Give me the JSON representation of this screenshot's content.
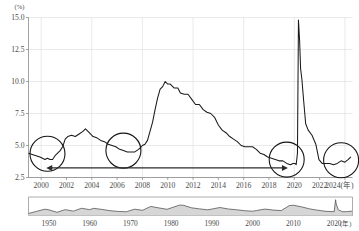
{
  "chart_data": {
    "type": "line",
    "title": "",
    "subtitle": "",
    "xlabel": "",
    "ylabel": "",
    "y_unit_label": "(%)",
    "x_unit_label": "(年)",
    "ylim": [
      2.5,
      15.0
    ],
    "xlim": [
      1999.0,
      2024.6
    ],
    "grid": true,
    "legend_position": "none",
    "y_ticks": [
      "15.0",
      "12.5",
      "10.0",
      "7.5",
      "5.0",
      "2.5"
    ],
    "y_tick_values": [
      15.0,
      12.5,
      10.0,
      7.5,
      5.0,
      2.5
    ],
    "x_ticks": [
      "2000",
      "2002",
      "2004",
      "2006",
      "2008",
      "2010",
      "2012",
      "2014",
      "2016",
      "2018",
      "2020",
      "2022",
      "2024"
    ],
    "x_tick_values": [
      2000,
      2002,
      2004,
      2006,
      2008,
      2010,
      2012,
      2014,
      2016,
      2018,
      2020,
      2022,
      2024
    ],
    "series": [
      {
        "name": "unemployment-rate",
        "x": [
          1999.0,
          1999.3,
          1999.6,
          1999.9,
          2000.1,
          2000.3,
          2000.5,
          2000.7,
          2000.9,
          2001.1,
          2001.3,
          2001.5,
          2001.7,
          2001.9,
          2002.1,
          2002.4,
          2002.7,
          2003.0,
          2003.3,
          2003.5,
          2003.8,
          2004.1,
          2004.4,
          2004.7,
          2005.0,
          2005.3,
          2005.6,
          2005.9,
          2006.2,
          2006.5,
          2006.8,
          2007.1,
          2007.4,
          2007.7,
          2008.0,
          2008.2,
          2008.4,
          2008.6,
          2008.8,
          2009.0,
          2009.2,
          2009.4,
          2009.6,
          2009.8,
          2010.0,
          2010.2,
          2010.5,
          2010.8,
          2011.0,
          2011.3,
          2011.6,
          2011.9,
          2012.2,
          2012.5,
          2012.8,
          2013.1,
          2013.4,
          2013.7,
          2014.0,
          2014.3,
          2014.6,
          2014.9,
          2015.2,
          2015.5,
          2015.8,
          2016.1,
          2016.4,
          2016.7,
          2017.0,
          2017.3,
          2017.6,
          2017.9,
          2018.2,
          2018.5,
          2018.8,
          2019.1,
          2019.4,
          2019.7,
          2019.9,
          2020.05,
          2020.15,
          2020.25,
          2020.33,
          2020.42,
          2020.5,
          2020.6,
          2020.75,
          2020.9,
          2021.1,
          2021.4,
          2021.7,
          2021.95,
          2022.2,
          2022.5,
          2022.8,
          2023.1,
          2023.4,
          2023.7,
          2024.0,
          2024.25,
          2024.45
        ],
        "y": [
          4.4,
          4.3,
          4.2,
          4.1,
          4.0,
          3.9,
          4.0,
          3.9,
          3.9,
          4.2,
          4.4,
          4.6,
          4.9,
          5.5,
          5.7,
          5.8,
          5.7,
          5.9,
          6.1,
          6.3,
          6.0,
          5.7,
          5.6,
          5.4,
          5.3,
          5.1,
          5.0,
          4.9,
          4.7,
          4.6,
          4.5,
          4.5,
          4.5,
          4.7,
          5.0,
          5.1,
          5.4,
          6.1,
          6.8,
          7.8,
          8.7,
          9.4,
          9.6,
          10.0,
          9.8,
          9.8,
          9.5,
          9.5,
          9.1,
          9.0,
          9.0,
          8.6,
          8.2,
          8.2,
          7.8,
          7.6,
          7.5,
          7.2,
          6.6,
          6.2,
          6.0,
          5.7,
          5.5,
          5.3,
          5.0,
          4.9,
          4.9,
          4.9,
          4.7,
          4.4,
          4.3,
          4.1,
          4.0,
          3.9,
          3.8,
          3.8,
          3.6,
          3.5,
          3.6,
          3.6,
          3.5,
          4.4,
          14.8,
          13.2,
          11.0,
          10.2,
          8.4,
          6.7,
          6.2,
          5.8,
          5.1,
          3.9,
          3.6,
          3.6,
          3.6,
          3.5,
          3.6,
          3.8,
          3.7,
          3.9,
          4.1
        ],
        "peak_covid_value": 14.8,
        "peak_gfc_value": 10.0,
        "note": "COVID spike drawn clipped above the 15.0 top gridline"
      }
    ],
    "annotations": [
      {
        "type": "ellipse",
        "name": "highlight-2000",
        "center_x": 2000.5,
        "center_y": 4.35,
        "label": ""
      },
      {
        "type": "ellipse",
        "name": "highlight-2006",
        "center_x": 2006.5,
        "center_y": 4.6,
        "label": ""
      },
      {
        "type": "ellipse",
        "name": "highlight-2019",
        "center_x": 2019.4,
        "center_y": 3.9,
        "label": ""
      },
      {
        "type": "ellipse",
        "name": "highlight-2023",
        "center_x": 2023.7,
        "center_y": 3.85,
        "label": ""
      },
      {
        "type": "double-arrow",
        "name": "span-arrow",
        "from_x": 2000.4,
        "to_x": 2019.5,
        "y": 3.25,
        "label": ""
      }
    ]
  },
  "mini_chart": {
    "type": "area",
    "x_unit_label": "(年)",
    "x_ticks": [
      "1950",
      "1960",
      "1970",
      "1980",
      "1990",
      "2000",
      "2010",
      "2020"
    ],
    "x_tick_values": [
      1950,
      1960,
      1970,
      1980,
      1990,
      2000,
      2010,
      2020
    ],
    "xlim": [
      1945,
      2024.5
    ],
    "ylim": [
      0,
      15
    ],
    "x": [
      1945,
      1947,
      1949,
      1950,
      1952,
      1954,
      1956,
      1958,
      1960,
      1961,
      1963,
      1965,
      1967,
      1969,
      1971,
      1973,
      1975,
      1977,
      1979,
      1980,
      1982,
      1983,
      1985,
      1987,
      1989,
      1991,
      1992,
      1994,
      1996,
      1998,
      2000,
      2001,
      2003,
      2005,
      2007,
      2009,
      2010,
      2012,
      2014,
      2016,
      2018,
      2019,
      2020.0,
      2020.35,
      2020.5,
      2021,
      2022,
      2023,
      2024.4
    ],
    "y": [
      1.9,
      3.9,
      5.9,
      5.3,
      3.0,
      5.5,
      4.1,
      6.8,
      5.5,
      6.7,
      5.7,
      4.5,
      3.8,
      3.5,
      5.9,
      4.9,
      8.5,
      7.1,
      5.8,
      7.1,
      9.7,
      9.6,
      7.2,
      6.2,
      5.3,
      6.8,
      7.5,
      6.1,
      5.4,
      4.5,
      4.0,
      4.7,
      6.0,
      5.1,
      4.6,
      9.3,
      9.6,
      8.1,
      6.2,
      4.9,
      3.9,
      3.7,
      3.6,
      14.8,
      11.0,
      5.4,
      3.6,
      3.6,
      4.1
    ]
  }
}
